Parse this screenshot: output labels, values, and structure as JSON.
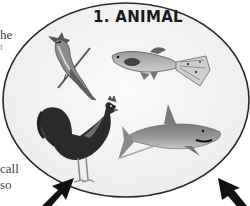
{
  "title": "1. ANIMAL",
  "side_text": {
    "fragment_1": "he",
    "fragment_2": "t",
    "fragment_3": "call",
    "fragment_4": "so"
  },
  "animals": [
    {
      "name": "blue jay",
      "icon": "bird-icon"
    },
    {
      "name": "guppy fish",
      "icon": "fish-icon"
    },
    {
      "name": "rooster",
      "icon": "rooster-icon"
    },
    {
      "name": "shark",
      "icon": "shark-icon"
    }
  ],
  "arrows": [
    {
      "direction": "up-right",
      "icon": "arrow-icon"
    },
    {
      "direction": "up-left",
      "icon": "arrow-icon"
    }
  ],
  "colors": {
    "ellipse_fill": "#f3f3f3",
    "ellipse_stroke": "#2a2a2a",
    "text": "#1a1a1a"
  }
}
